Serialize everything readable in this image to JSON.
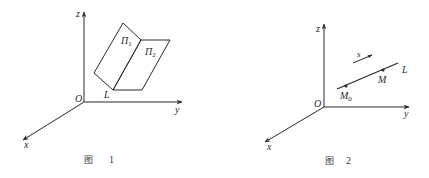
{
  "figures": [
    {
      "caption": {
        "prefix": "图",
        "number": "1"
      },
      "axes": {
        "x_label": "x",
        "y_label": "y",
        "z_label": "z",
        "origin_label": "O"
      },
      "planes": [
        {
          "label": "Π",
          "subscript": "1"
        },
        {
          "label": "Π",
          "subscript": "2"
        }
      ],
      "line_label": "L"
    },
    {
      "caption": {
        "prefix": "图",
        "number": "2"
      },
      "axes": {
        "x_label": "x",
        "y_label": "y",
        "z_label": "z",
        "origin_label": "O"
      },
      "vector_label": "s",
      "line_label": "L",
      "points": [
        {
          "label": "M",
          "subscript": "0"
        },
        {
          "label": "M",
          "subscript": ""
        }
      ]
    }
  ],
  "colors": {
    "ink": "#2a2a2a",
    "background": "#ffffff"
  }
}
